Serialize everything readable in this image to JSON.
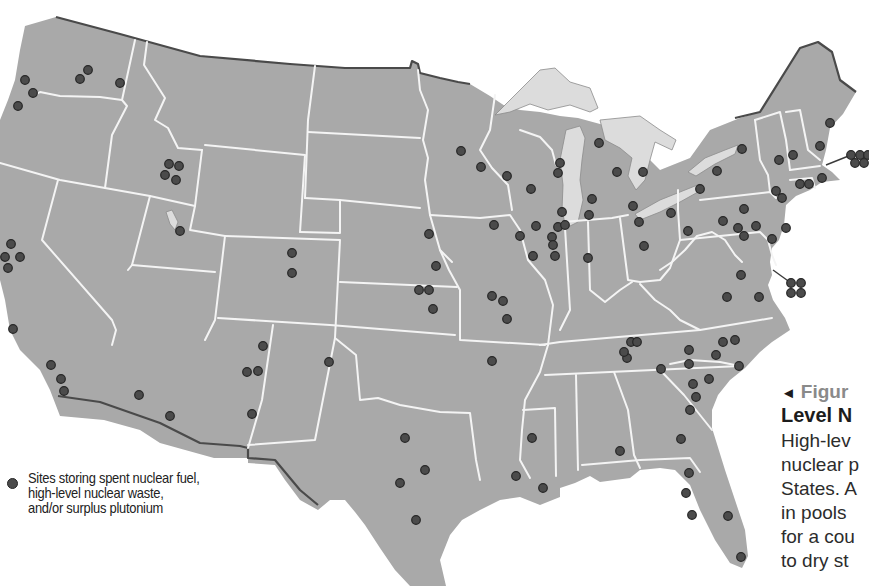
{
  "map": {
    "title_hidden": "",
    "colors": {
      "land": "#a9a9a9",
      "state_borders": "#f4f4f4",
      "international_border": "#4a4a4a",
      "lakes": "#dcdcdc",
      "site_dot": "#4b4b4b",
      "background": "#ffffff"
    },
    "sites": [
      {
        "x": 88,
        "y": 70
      },
      {
        "x": 80,
        "y": 79
      },
      {
        "x": 120,
        "y": 83
      },
      {
        "x": 25,
        "y": 80
      },
      {
        "x": 33,
        "y": 93
      },
      {
        "x": 18,
        "y": 106
      },
      {
        "x": 169,
        "y": 164
      },
      {
        "x": 179,
        "y": 166
      },
      {
        "x": 165,
        "y": 175
      },
      {
        "x": 176,
        "y": 180
      },
      {
        "x": 180,
        "y": 231
      },
      {
        "x": 11,
        "y": 244
      },
      {
        "x": 20,
        "y": 257
      },
      {
        "x": 5,
        "y": 257
      },
      {
        "x": 8,
        "y": 268
      },
      {
        "x": 13,
        "y": 329
      },
      {
        "x": 51,
        "y": 365
      },
      {
        "x": 61,
        "y": 379
      },
      {
        "x": 64,
        "y": 391
      },
      {
        "x": 292,
        "y": 253
      },
      {
        "x": 292,
        "y": 273
      },
      {
        "x": 263,
        "y": 346
      },
      {
        "x": 247,
        "y": 372
      },
      {
        "x": 258,
        "y": 371
      },
      {
        "x": 252,
        "y": 414
      },
      {
        "x": 329,
        "y": 362
      },
      {
        "x": 139,
        "y": 395
      },
      {
        "x": 170,
        "y": 416
      },
      {
        "x": 461,
        "y": 151
      },
      {
        "x": 481,
        "y": 167
      },
      {
        "x": 507,
        "y": 176
      },
      {
        "x": 531,
        "y": 189
      },
      {
        "x": 560,
        "y": 163
      },
      {
        "x": 558,
        "y": 173
      },
      {
        "x": 599,
        "y": 143
      },
      {
        "x": 617,
        "y": 172
      },
      {
        "x": 429,
        "y": 234
      },
      {
        "x": 436,
        "y": 266
      },
      {
        "x": 494,
        "y": 225
      },
      {
        "x": 429,
        "y": 290
      },
      {
        "x": 520,
        "y": 236
      },
      {
        "x": 536,
        "y": 226
      },
      {
        "x": 552,
        "y": 237
      },
      {
        "x": 558,
        "y": 227
      },
      {
        "x": 565,
        "y": 225
      },
      {
        "x": 562,
        "y": 212
      },
      {
        "x": 592,
        "y": 199
      },
      {
        "x": 589,
        "y": 215
      },
      {
        "x": 533,
        "y": 256
      },
      {
        "x": 555,
        "y": 256
      },
      {
        "x": 553,
        "y": 245
      },
      {
        "x": 588,
        "y": 258
      },
      {
        "x": 633,
        "y": 206
      },
      {
        "x": 639,
        "y": 222
      },
      {
        "x": 644,
        "y": 246
      },
      {
        "x": 671,
        "y": 213
      },
      {
        "x": 688,
        "y": 231
      },
      {
        "x": 419,
        "y": 290
      },
      {
        "x": 433,
        "y": 309
      },
      {
        "x": 492,
        "y": 296
      },
      {
        "x": 503,
        "y": 301
      },
      {
        "x": 507,
        "y": 319
      },
      {
        "x": 492,
        "y": 361
      },
      {
        "x": 631,
        "y": 342
      },
      {
        "x": 637,
        "y": 342
      },
      {
        "x": 627,
        "y": 358
      },
      {
        "x": 624,
        "y": 352
      },
      {
        "x": 661,
        "y": 369
      },
      {
        "x": 689,
        "y": 350
      },
      {
        "x": 689,
        "y": 364
      },
      {
        "x": 693,
        "y": 384
      },
      {
        "x": 709,
        "y": 379
      },
      {
        "x": 696,
        "y": 397
      },
      {
        "x": 735,
        "y": 340
      },
      {
        "x": 723,
        "y": 342
      },
      {
        "x": 739,
        "y": 366
      },
      {
        "x": 690,
        "y": 410
      },
      {
        "x": 681,
        "y": 439
      },
      {
        "x": 716,
        "y": 355
      },
      {
        "x": 741,
        "y": 275
      },
      {
        "x": 727,
        "y": 297
      },
      {
        "x": 759,
        "y": 297
      },
      {
        "x": 643,
        "y": 172
      },
      {
        "x": 717,
        "y": 171
      },
      {
        "x": 742,
        "y": 149
      },
      {
        "x": 700,
        "y": 189
      },
      {
        "x": 779,
        "y": 160
      },
      {
        "x": 793,
        "y": 155
      },
      {
        "x": 830,
        "y": 123
      },
      {
        "x": 820,
        "y": 146
      },
      {
        "x": 776,
        "y": 191
      },
      {
        "x": 782,
        "y": 198
      },
      {
        "x": 800,
        "y": 184
      },
      {
        "x": 809,
        "y": 184
      },
      {
        "x": 822,
        "y": 178
      },
      {
        "x": 744,
        "y": 209
      },
      {
        "x": 723,
        "y": 221
      },
      {
        "x": 738,
        "y": 228
      },
      {
        "x": 744,
        "y": 236
      },
      {
        "x": 756,
        "y": 226
      },
      {
        "x": 786,
        "y": 228
      },
      {
        "x": 772,
        "y": 239
      },
      {
        "x": 405,
        "y": 438
      },
      {
        "x": 425,
        "y": 470
      },
      {
        "x": 400,
        "y": 483
      },
      {
        "x": 416,
        "y": 520
      },
      {
        "x": 532,
        "y": 438
      },
      {
        "x": 516,
        "y": 476
      },
      {
        "x": 543,
        "y": 488
      },
      {
        "x": 620,
        "y": 451
      },
      {
        "x": 689,
        "y": 473
      },
      {
        "x": 686,
        "y": 493
      },
      {
        "x": 692,
        "y": 515
      },
      {
        "x": 728,
        "y": 516
      },
      {
        "x": 741,
        "y": 557
      }
    ],
    "clusters": [
      {
        "name": "maryland-cluster",
        "leader_from": {
          "x": 773,
          "y": 270
        },
        "dots": [
          {
            "x": 791,
            "y": 283
          },
          {
            "x": 801,
            "y": 283
          },
          {
            "x": 791,
            "y": 293
          },
          {
            "x": 801,
            "y": 293
          }
        ]
      },
      {
        "name": "massachusetts-cluster",
        "leader_from": {
          "x": 826,
          "y": 165
        },
        "dots": [
          {
            "x": 851,
            "y": 155
          },
          {
            "x": 860,
            "y": 155
          },
          {
            "x": 868,
            "y": 155
          },
          {
            "x": 855,
            "y": 163
          },
          {
            "x": 864,
            "y": 163
          }
        ]
      }
    ]
  },
  "legend": {
    "symbol": "site-dot",
    "lines": [
      "Sites storing spent nuclear fuel,",
      "high-level nuclear waste,",
      "and/or surplus plutonium"
    ]
  },
  "caption": {
    "marker": "◄",
    "label": "Figur",
    "title": "Level N",
    "body_lines": [
      "High-lev",
      "nuclear p",
      "States. A",
      "in pools",
      "for a cou",
      "to dry st"
    ]
  }
}
